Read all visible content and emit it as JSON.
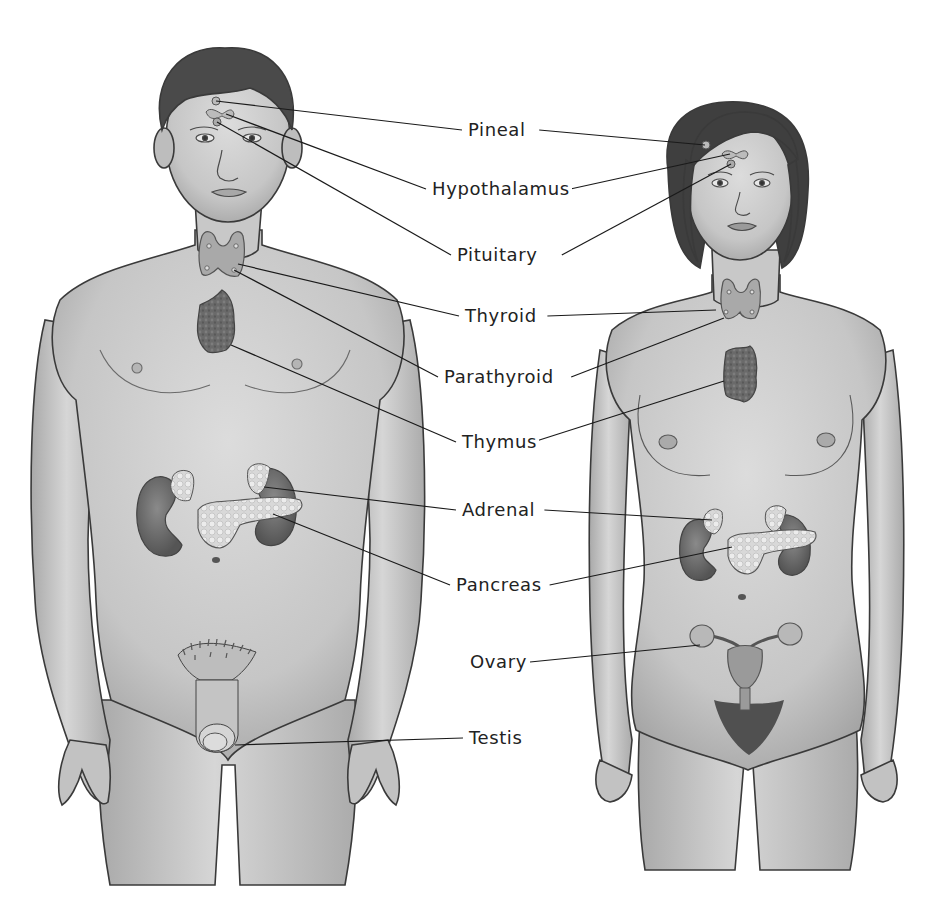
{
  "diagram": {
    "colors": {
      "background": "#ffffff",
      "skin": "#cfcfcf",
      "skin_shadow": "#a8a8a8",
      "outline": "#3a3a3a",
      "hair": "#4a4a4a",
      "organ_dark": "#6c6c6c",
      "organ_light": "#dcdcdc",
      "leader_line": "#1a1a1a",
      "label_text": "#222222"
    },
    "labels": [
      {
        "id": "pineal",
        "text": "Pineal",
        "x": 466,
        "y": 130,
        "male_target": [
          216,
          101
        ],
        "female_target": [
          705,
          145
        ]
      },
      {
        "id": "hypothalamus",
        "text": "Hypothalamus",
        "x": 430,
        "y": 189,
        "male_target": [
          226,
          114
        ],
        "female_target": [
          730,
          154
        ]
      },
      {
        "id": "pituitary",
        "text": "Pituitary",
        "x": 455,
        "y": 255,
        "male_target": [
          217,
          122
        ],
        "female_target": [
          731,
          164
        ]
      },
      {
        "id": "thyroid",
        "text": "Thyroid",
        "x": 463,
        "y": 316,
        "male_target": [
          238,
          264
        ],
        "female_target": [
          716,
          310
        ]
      },
      {
        "id": "parathyroid",
        "text": "Parathyroid",
        "x": 442,
        "y": 377,
        "male_target": [
          234,
          270
        ],
        "female_target": [
          724,
          318
        ]
      },
      {
        "id": "thymus",
        "text": "Thymus",
        "x": 460,
        "y": 442,
        "male_target": [
          231,
          345
        ],
        "female_target": [
          724,
          381
        ]
      },
      {
        "id": "adrenal",
        "text": "Adrenal",
        "x": 460,
        "y": 510,
        "male_target": [
          264,
          487
        ],
        "female_target": [
          712,
          520
        ]
      },
      {
        "id": "pancreas",
        "text": "Pancreas",
        "x": 454,
        "y": 585,
        "male_target": [
          273,
          514
        ],
        "female_target": [
          732,
          547
        ]
      },
      {
        "id": "ovary",
        "text": "Ovary",
        "x": 468,
        "y": 662,
        "male_target": null,
        "female_target": [
          700,
          645
        ]
      },
      {
        "id": "testis",
        "text": "Testis",
        "x": 467,
        "y": 738,
        "male_target": [
          235,
          745
        ],
        "female_target": null
      }
    ],
    "figures": [
      {
        "id": "male",
        "name": "Male figure"
      },
      {
        "id": "female",
        "name": "Female figure"
      }
    ]
  }
}
